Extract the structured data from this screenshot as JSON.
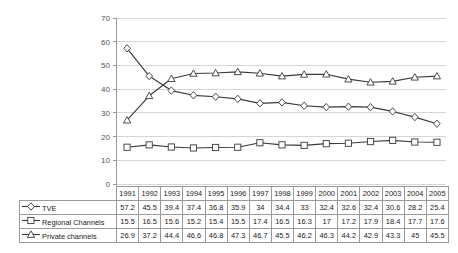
{
  "chart_data": {
    "type": "line",
    "title": "",
    "xlabel": "",
    "ylabel": "",
    "ylim": [
      0,
      70
    ],
    "ytick_step": 10,
    "yticks": [
      0,
      10,
      20,
      30,
      40,
      50,
      60,
      70
    ],
    "grid": "horizontal",
    "legend_position": "table-left",
    "categories": [
      "1991",
      "1992",
      "1993",
      "1994",
      "1995",
      "1996",
      "1997",
      "1998",
      "1999",
      "2000",
      "2001",
      "2002",
      "2003",
      "2004",
      "2005"
    ],
    "series": [
      {
        "name": "TVE",
        "marker": "diamond",
        "color": "#3a3a3a",
        "values": [
          57.2,
          45.5,
          39.4,
          37.4,
          36.8,
          35.9,
          34,
          34.4,
          33,
          32.4,
          32.6,
          32.4,
          30.6,
          28.2,
          25.4
        ]
      },
      {
        "name": "Regional Channels",
        "marker": "square",
        "color": "#3a3a3a",
        "values": [
          15.5,
          16.5,
          15.6,
          15.2,
          15.4,
          15.5,
          17.4,
          16.5,
          16.3,
          17,
          17.2,
          17.9,
          18.4,
          17.7,
          17.6
        ]
      },
      {
        "name": "Private channels",
        "marker": "triangle",
        "color": "#3a3a3a",
        "values": [
          26.9,
          37.2,
          44.4,
          46.6,
          46.8,
          47.3,
          46.7,
          45.5,
          46.2,
          46.3,
          44.2,
          42.9,
          43.3,
          45,
          45.5
        ]
      }
    ]
  },
  "table": {
    "corner_label": "",
    "year_headers": [
      "1991",
      "1992",
      "1993",
      "1994",
      "1995",
      "1996",
      "1997",
      "1998",
      "1999",
      "2000",
      "2001",
      "2002",
      "2003",
      "2004",
      "2005"
    ],
    "rows": [
      {
        "label": "TVE",
        "marker": "diamond",
        "values": [
          "57.2",
          "45.5",
          "39.4",
          "37.4",
          "36.8",
          "35.9",
          "34",
          "34.4",
          "33",
          "32.4",
          "32.6",
          "32.4",
          "30.6",
          "28.2",
          "25.4"
        ]
      },
      {
        "label": "Regional Channels",
        "marker": "square",
        "values": [
          "15.5",
          "16.5",
          "15.6",
          "15.2",
          "15.4",
          "15.5",
          "17.4",
          "16.5",
          "16.3",
          "17",
          "17.2",
          "17.9",
          "18.4",
          "17.7",
          "17.6"
        ]
      },
      {
        "label": "Private channels",
        "marker": "triangle",
        "values": [
          "26.9",
          "37.2",
          "44.4",
          "46.6",
          "46.8",
          "47.3",
          "46.7",
          "45.5",
          "46.2",
          "46.3",
          "44.2",
          "42.9",
          "43.3",
          "45",
          "45.5"
        ]
      }
    ]
  },
  "colors": {
    "line": "#3a3a3a",
    "grid": "#d6d6d6",
    "axis": "#9a9a9a",
    "tick_text": "#555555",
    "table_border": "#9a9a9a",
    "marker_fill": "#ffffff"
  }
}
